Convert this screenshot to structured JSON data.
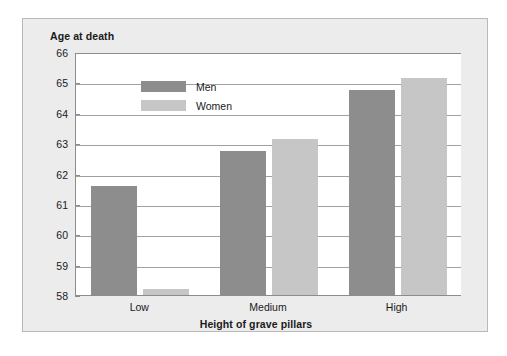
{
  "chart_data": {
    "type": "bar",
    "title": "",
    "ylabel": "Age at death",
    "xlabel": "Height of grave pillars",
    "categories": [
      "Low",
      "Medium",
      "High"
    ],
    "series": [
      {
        "name": "Men",
        "color": "#8d8d8d",
        "values": [
          61.6,
          62.75,
          64.75
        ]
      },
      {
        "name": "Women",
        "color": "#c6c6c6",
        "values": [
          58.2,
          63.15,
          65.15
        ]
      }
    ],
    "ylim": [
      58,
      66
    ],
    "ytick_labels": [
      "66",
      "65",
      "64",
      "63",
      "62",
      "61",
      "60",
      "59",
      "58"
    ],
    "ytick_values": [
      66,
      65,
      64,
      63,
      62,
      61,
      60,
      59,
      58
    ],
    "ystep": 1,
    "grid": true,
    "legend_position": "upper-left-inside",
    "legend_entries": [
      "Men",
      "Women"
    ]
  },
  "figure": {
    "background": "#ececed",
    "plot_background": "#ffffff",
    "axis_color": "#8c8c8c",
    "grid_color": "#a0a0a0"
  }
}
